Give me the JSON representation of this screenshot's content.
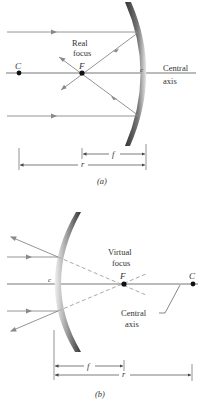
{
  "colors": {
    "ray": "#888888",
    "axis": "#666666",
    "point": "#111111",
    "text": "#333333",
    "mirror_dark": "#555555",
    "mirror_light": "#e0e0e0"
  },
  "panel_a": {
    "caption": "(a)",
    "focus_label_line1": "Real",
    "focus_label_line2": "focus",
    "axis_label_line1": "Central",
    "axis_label_line2": "axis",
    "point_center": "C",
    "point_focus": "F",
    "point_vertex": "c",
    "dim_focal": "f",
    "dim_radius": "r"
  },
  "panel_b": {
    "caption": "(b)",
    "focus_label_line1": "Virtual",
    "focus_label_line2": "focus",
    "axis_label_line1": "Central",
    "axis_label_line2": "axis",
    "point_center": "C",
    "point_focus": "F",
    "point_vertex": "c",
    "dim_focal": "f",
    "dim_radius": "r"
  }
}
